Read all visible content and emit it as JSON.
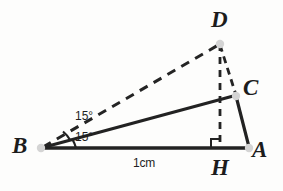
{
  "figure": {
    "kind": "geometry-diagram",
    "background_color": "#fdfdfc",
    "stroke_color": "#222222",
    "point_marker_color": "#cfcfcf",
    "width": 283,
    "height": 191
  },
  "points": {
    "B": {
      "label": "B",
      "x": 41,
      "y": 148,
      "label_x": 12,
      "label_y": 136
    },
    "A": {
      "label": "A",
      "x": 249,
      "y": 148,
      "label_x": 252,
      "label_y": 139
    },
    "H": {
      "label": "H",
      "x": 220,
      "y": 148,
      "label_x": 211,
      "label_y": 156
    },
    "C": {
      "label": "C",
      "x": 236,
      "y": 96,
      "label_x": 243,
      "label_y": 76
    },
    "D": {
      "label": "D",
      "x": 220,
      "y": 43,
      "label_x": 211,
      "label_y": 9
    }
  },
  "segments": [
    {
      "name": "segment-BA",
      "from": "B",
      "to": "A",
      "style": "solid",
      "width": 3.2
    },
    {
      "name": "segment-BC",
      "from": "B",
      "to": "C",
      "style": "solid",
      "width": 3.2
    },
    {
      "name": "segment-CA",
      "from": "C",
      "to": "A",
      "style": "solid",
      "width": 3.2
    },
    {
      "name": "segment-BD",
      "from": "B",
      "to": "D",
      "style": "dashed",
      "width": 3.0
    },
    {
      "name": "segment-DC",
      "from": "D",
      "to": "C",
      "style": "dashed",
      "width": 2.6
    },
    {
      "name": "segment-DH",
      "from": "D",
      "to": "H",
      "style": "dashed",
      "width": 2.6
    }
  ],
  "angles": [
    {
      "name": "angle-DBC",
      "vertex": "B",
      "value": "15°",
      "label_x": 75,
      "label_y": 112
    },
    {
      "name": "angle-CBA",
      "vertex": "B",
      "value": "15°",
      "label_x": 75,
      "label_y": 132
    }
  ],
  "measurements": [
    {
      "name": "length-BA",
      "value": "1cm",
      "label_x": 133,
      "label_y": 158
    }
  ],
  "markers": {
    "right_angle": {
      "name": "right-angle-marker-H",
      "at": "H",
      "size": 9,
      "note": "square marker indicating DH perpendicular to BA"
    }
  }
}
